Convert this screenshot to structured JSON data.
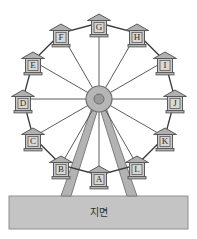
{
  "diagram": {
    "ground": {
      "label": "지면"
    },
    "colors": {
      "background": "#ffffff",
      "ground_fill": "#c4c4c4",
      "ground_stroke": "#8f8f8f",
      "rim_stroke": "#3a3a3a",
      "spoke_stroke": "#4a4a4a",
      "hub_fill": "#b6b6b6",
      "hub_stroke": "#6e6e6e",
      "hub_core_fill": "#9a9a9a",
      "cabin_body_fill": "#c9c9c9",
      "cabin_panel_fill": "#d8d8d8",
      "cabin_stroke": "#5a5a5a",
      "roof_fill": "#b0b0b0",
      "leg_fill": "#b3b3b3",
      "leg_stroke": "#7d7d7d",
      "node_fill": "#1a1a1a",
      "letter_color": "#2b2b2b"
    },
    "wheel": {
      "center_x": 99,
      "center_y": 99,
      "radius": 76,
      "hub_radius": 13,
      "hub_core_radius": 5,
      "cabin_count": 12,
      "cabin_offset": 16
    },
    "cabins": [
      {
        "label": "A",
        "angle_deg": 90,
        "x": 99,
        "y": 175,
        "position": "bottom-center"
      },
      {
        "label": "B",
        "angle_deg": 120,
        "x": 61,
        "y": 165,
        "position": "bottom-left"
      },
      {
        "label": "C",
        "angle_deg": 150,
        "x": 33,
        "y": 137,
        "position": "lower-left"
      },
      {
        "label": "D",
        "angle_deg": 180,
        "x": 23,
        "y": 99,
        "position": "left"
      },
      {
        "label": "E",
        "angle_deg": 210,
        "x": 33,
        "y": 61,
        "position": "upper-left"
      },
      {
        "label": "F",
        "angle_deg": 240,
        "x": 61,
        "y": 33,
        "position": "top-left"
      },
      {
        "label": "G",
        "angle_deg": 270,
        "x": 99,
        "y": 23,
        "position": "top-center"
      },
      {
        "label": "H",
        "angle_deg": 300,
        "x": 137,
        "y": 33,
        "position": "top-right"
      },
      {
        "label": "I",
        "angle_deg": 330,
        "x": 165,
        "y": 61,
        "position": "upper-right"
      },
      {
        "label": "J",
        "angle_deg": 0,
        "x": 175,
        "y": 99,
        "position": "right"
      },
      {
        "label": "K",
        "angle_deg": 30,
        "x": 165,
        "y": 137,
        "position": "lower-right"
      },
      {
        "label": "L",
        "angle_deg": 60,
        "x": 137,
        "y": 165,
        "position": "bottom-right"
      }
    ],
    "supports": [
      {
        "name": "left-leg",
        "top_x": 95,
        "top_y": 108,
        "base_x": 66,
        "base_y": 196
      },
      {
        "name": "right-leg",
        "top_x": 103,
        "top_y": 108,
        "base_x": 132,
        "base_y": 196
      }
    ],
    "ground_rect": {
      "x": 9,
      "y": 196,
      "width": 179,
      "height": 33
    }
  }
}
